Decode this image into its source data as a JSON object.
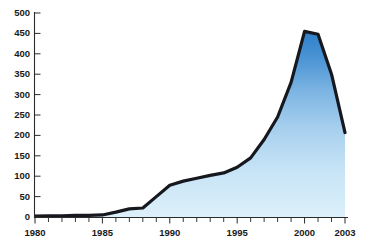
{
  "chart_data": {
    "type": "area",
    "title": "",
    "subtitle": "",
    "xlabel": "",
    "ylabel": "",
    "x": [
      1980,
      1981,
      1982,
      1983,
      1984,
      1985,
      1986,
      1987,
      1988,
      1989,
      1990,
      1991,
      1992,
      1993,
      1994,
      1995,
      1996,
      1997,
      1998,
      1999,
      2000,
      2001,
      2002,
      2003
    ],
    "values": [
      2,
      3,
      3,
      4,
      4,
      5,
      12,
      20,
      22,
      50,
      78,
      88,
      95,
      102,
      108,
      122,
      145,
      190,
      245,
      330,
      455,
      448,
      350,
      207
    ],
    "series": [
      {
        "name": "series-1",
        "values": [
          2,
          3,
          3,
          4,
          4,
          5,
          12,
          20,
          22,
          50,
          78,
          88,
          95,
          102,
          108,
          122,
          145,
          190,
          245,
          330,
          455,
          448,
          350,
          207
        ]
      }
    ],
    "xlim": [
      1980,
      2003
    ],
    "ylim": [
      0,
      500
    ],
    "yticks": [
      0,
      50,
      100,
      150,
      200,
      250,
      300,
      350,
      400,
      450,
      500
    ],
    "ytick_labels": [
      "0",
      "50",
      "100",
      "150",
      "200",
      "250",
      "300",
      "350",
      "400",
      "450",
      "500"
    ],
    "xticks_major": [
      1980,
      1985,
      1990,
      1995,
      2000,
      2003
    ],
    "xtick_labels": [
      "1980",
      "1985",
      "1990",
      "1995",
      "2000",
      "2003"
    ],
    "xticks_minor": [
      1981,
      1982,
      1983,
      1984,
      1986,
      1987,
      1988,
      1989,
      1991,
      1992,
      1993,
      1994,
      1996,
      1997,
      1998,
      1999,
      2001,
      2002
    ],
    "grid": false,
    "legend": null,
    "legend_position": "none",
    "annotations": [],
    "colors": {
      "fill_top": "#2e7fc8",
      "fill_bottom": "#dcf0fa",
      "line": "#16181d",
      "axis": "#2b2b2b",
      "text": "#1a1a1a",
      "background": "#ffffff"
    }
  }
}
